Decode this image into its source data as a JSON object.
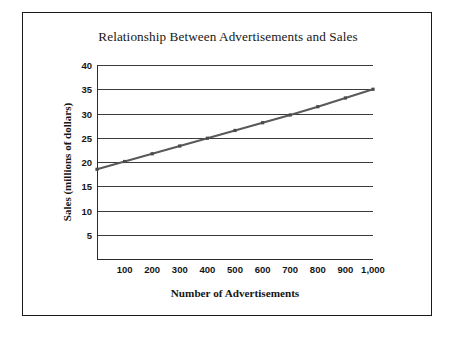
{
  "chart_data": {
    "type": "line",
    "title": "Relationship Between Advertisements and Sales",
    "xlabel": "Number of Advertisements",
    "ylabel": "Sales (millions of dollars)",
    "xlim": [
      0,
      1000
    ],
    "ylim": [
      0,
      40
    ],
    "grid": true,
    "legend": false,
    "line_color": "#595959",
    "marker_color": "#4a4a4a",
    "y_ticks": [
      5,
      10,
      15,
      20,
      25,
      30,
      35,
      40
    ],
    "y_tick_labels": [
      "5",
      "10",
      "15",
      "20",
      "25",
      "30",
      "35",
      "40"
    ],
    "x_ticks": [
      100,
      200,
      300,
      400,
      500,
      600,
      700,
      800,
      900,
      1000
    ],
    "x_tick_labels": [
      "100",
      "200",
      "300",
      "400",
      "500",
      "600",
      "700",
      "800",
      "900",
      "1,000"
    ],
    "x": [
      0,
      100,
      200,
      300,
      400,
      500,
      600,
      700,
      800,
      900,
      1000
    ],
    "values": [
      18.5,
      20.1,
      21.7,
      23.3,
      24.9,
      26.5,
      28.1,
      29.7,
      31.4,
      33.2,
      35.0
    ],
    "series": [
      {
        "name": "Sales",
        "x": [
          0,
          100,
          200,
          300,
          400,
          500,
          600,
          700,
          800,
          900,
          1000
        ],
        "values": [
          18.5,
          20.1,
          21.7,
          23.3,
          24.9,
          26.5,
          28.1,
          29.7,
          31.4,
          33.2,
          35.0
        ]
      }
    ]
  }
}
